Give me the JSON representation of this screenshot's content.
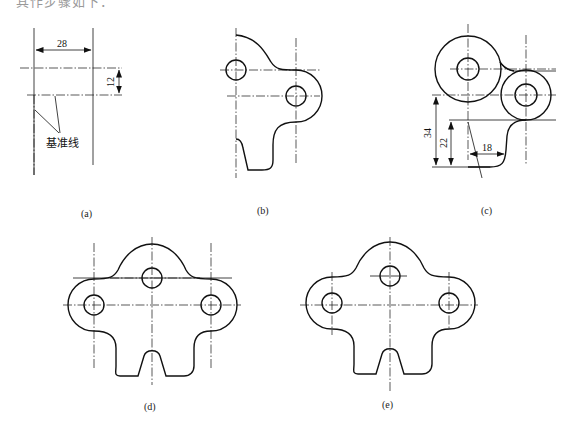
{
  "header": {
    "text": "其作步骤如下："
  },
  "figures": [
    {
      "id": "a",
      "caption": "(a)",
      "dimensions": [
        "28",
        "12"
      ],
      "annotation": "基准线"
    },
    {
      "id": "b",
      "caption": "(b)"
    },
    {
      "id": "c",
      "caption": "(c)",
      "dimensions": [
        "34",
        "22",
        "18"
      ]
    },
    {
      "id": "d",
      "caption": "(d)"
    },
    {
      "id": "e",
      "caption": "(e)"
    }
  ]
}
